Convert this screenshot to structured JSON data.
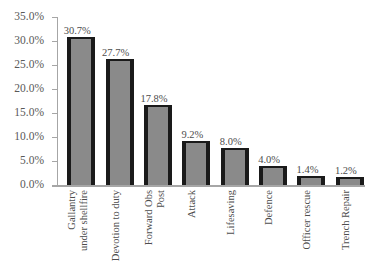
{
  "chart_data": {
    "type": "bar",
    "title": "",
    "xlabel": "",
    "ylabel": "",
    "ylim": [
      0,
      35
    ],
    "grid": false,
    "legend": false,
    "orientation": "vertical",
    "bar_color": "#8a8a8a",
    "bar_edge_color": "#1a1a1a",
    "axis_color": "#a6a6a6",
    "text_color": "#595959",
    "categories": [
      "Gallantry under shellfire",
      "Devotion to duty",
      "Forward Obs Post",
      "Attack",
      "Lifesaving",
      "Defence",
      "Officer rescue",
      "Trench Repair"
    ],
    "category_lines": [
      [
        "Gallantry",
        "under shellfire"
      ],
      [
        "Devotion to duty"
      ],
      [
        "Forward Obs",
        "Post"
      ],
      [
        "Attack"
      ],
      [
        "Lifesaving"
      ],
      [
        "Defence"
      ],
      [
        "Officer rescue"
      ],
      [
        "Trench Repair"
      ]
    ],
    "values": [
      30.7,
      27.7,
      17.8,
      9.2,
      8.0,
      4.0,
      1.4,
      1.2
    ],
    "value_labels": [
      "30.7%",
      "27.7%",
      "17.8%",
      "9.2%",
      "8.0%",
      "4.0%",
      "1.4%",
      "1.2%"
    ],
    "bar_pixel_pct": [
      30.5,
      25.8,
      16.3,
      8.7,
      7.2,
      3.6,
      1.4,
      1.2
    ],
    "ytick_labels": [
      "35.0%",
      "30.0%",
      "25.0%",
      "20.0%",
      "15.0%",
      "10.0%",
      "5.0%",
      "0.0%"
    ],
    "ytick_values": [
      35,
      30,
      25,
      20,
      15,
      10,
      5,
      0
    ]
  }
}
